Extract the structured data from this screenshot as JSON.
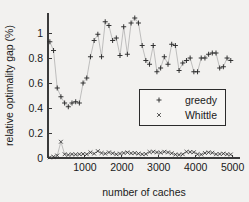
{
  "chart_data": {
    "type": "scatter",
    "title": "",
    "xlabel": "number of caches",
    "ylabel": "relative optimality gap (%)",
    "xlim": [
      0,
      5200
    ],
    "ylim": [
      0,
      1.16
    ],
    "xticks": [
      1000,
      2000,
      3000,
      4000,
      5000
    ],
    "xtick_labels": [
      "1000",
      "2000",
      "3000",
      "4000",
      "5000"
    ],
    "yticks": [
      0,
      0.2,
      0.4,
      0.6,
      0.8,
      1
    ],
    "ytick_labels": [
      "0",
      "0.2",
      "0.4",
      "0.6",
      "0.8",
      "1"
    ],
    "grid": false,
    "legend_position": "center-right",
    "connect_points": true,
    "series": [
      {
        "name": "greedy",
        "marker": "plus",
        "color": "#2b2b2b",
        "x": [
          50,
          150,
          250,
          350,
          450,
          550,
          650,
          750,
          850,
          950,
          1050,
          1150,
          1250,
          1350,
          1450,
          1550,
          1650,
          1750,
          1850,
          1950,
          2050,
          2150,
          2250,
          2350,
          2450,
          2550,
          2650,
          2750,
          2850,
          2950,
          3050,
          3150,
          3250,
          3350,
          3450,
          3550,
          3650,
          3750,
          3850,
          3950,
          4050,
          4150,
          4250,
          4350,
          4450,
          4550,
          4650,
          4750,
          4850,
          4950
        ],
        "values": [
          0.93,
          0.86,
          0.56,
          0.49,
          0.44,
          0.41,
          0.44,
          0.45,
          0.44,
          0.6,
          0.64,
          0.81,
          0.94,
          0.99,
          0.81,
          1.09,
          1.06,
          0.94,
          0.96,
          0.82,
          1.05,
          0.83,
          1.08,
          1.12,
          1.08,
          0.9,
          0.78,
          0.75,
          0.9,
          0.69,
          0.72,
          0.81,
          0.75,
          0.91,
          0.9,
          0.7,
          0.76,
          0.78,
          0.8,
          0.69,
          0.69,
          0.8,
          0.8,
          0.83,
          0.84,
          0.84,
          0.72,
          0.73,
          0.8,
          0.78
        ]
      },
      {
        "name": "Whittle",
        "marker": "cross",
        "color": "#2b2b2b",
        "x": [
          50,
          150,
          250,
          350,
          450,
          550,
          650,
          750,
          850,
          950,
          1050,
          1150,
          1250,
          1350,
          1450,
          1550,
          1650,
          1750,
          1850,
          1950,
          2050,
          2150,
          2250,
          2350,
          2450,
          2550,
          2650,
          2750,
          2850,
          2950,
          3050,
          3150,
          3250,
          3350,
          3450,
          3550,
          3650,
          3750,
          3850,
          3950,
          4050,
          4150,
          4250,
          4350,
          4450,
          4550,
          4650,
          4750,
          4850,
          4950
        ],
        "values": [
          0.005,
          0.01,
          0.02,
          0.13,
          0.03,
          0.025,
          0.03,
          0.028,
          0.03,
          0.032,
          0.03,
          0.045,
          0.035,
          0.055,
          0.04,
          0.035,
          0.045,
          0.038,
          0.03,
          0.035,
          0.04,
          0.045,
          0.038,
          0.04,
          0.035,
          0.03,
          0.032,
          0.048,
          0.05,
          0.045,
          0.042,
          0.05,
          0.045,
          0.038,
          0.028,
          0.026,
          0.03,
          0.05,
          0.048,
          0.046,
          0.03,
          0.028,
          0.04,
          0.045,
          0.042,
          0.03,
          0.032,
          0.035,
          0.03,
          0.028
        ]
      }
    ]
  },
  "legend": {
    "entries": [
      {
        "marker": "plus",
        "label": "greedy"
      },
      {
        "marker": "cross",
        "label": "Whittle"
      }
    ]
  }
}
